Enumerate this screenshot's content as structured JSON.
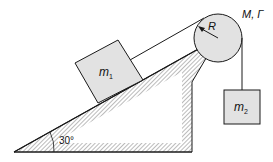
{
  "diagram": {
    "labels": {
      "block1_main": "m",
      "block1_sub": "1",
      "block2_main": "m",
      "block2_sub": "2",
      "radius": "R",
      "pulley_props": "M, Γ",
      "angle": "30°"
    },
    "colors": {
      "block_fill": "#e2e2e2",
      "pulley_fill": "#e2e2e2",
      "stroke": "#1a1a1a",
      "hatch": "#555555",
      "background": "#ffffff"
    }
  }
}
